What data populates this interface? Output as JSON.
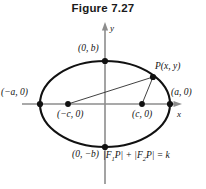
{
  "figure": {
    "title": "Figure 7.27",
    "caption_equation": "|F1P| + |F2P| = k"
  },
  "axes": {
    "x_label": "x",
    "y_label": "y",
    "axis_color": "#8c8c8c"
  },
  "curve": {
    "shape": "ellipse",
    "stroke_color": "#111111",
    "center_px": [
      105,
      104
    ],
    "semi_major_px": 65,
    "semi_minor_px": 43
  },
  "labels": {
    "vertex_left": "(−a, 0)",
    "vertex_right": "(a, 0)",
    "covertex_top": "(0, b)",
    "covertex_bottom": "(0, −b)",
    "focus_left": "(−c, 0)",
    "focus_right": "(c, 0)",
    "point_p": "P(x, y)"
  },
  "equation_parts": {
    "bar_open_1": "|",
    "f1": "F",
    "sub1": "1",
    "p1": "P",
    "bar_close_1": "|",
    "plus": "+",
    "bar_open_2": "|",
    "f2": "F",
    "sub2": "2",
    "p2": "P",
    "bar_close_2": "|",
    "equals": "= k"
  },
  "points": {
    "vertex_left_px": [
      40,
      104
    ],
    "vertex_right_px": [
      170,
      104
    ],
    "covertex_top_px": [
      105,
      61
    ],
    "covertex_bottom_px": [
      105,
      147
    ],
    "focus_left_px": [
      68,
      104
    ],
    "focus_right_px": [
      142,
      104
    ],
    "point_p_px": [
      153,
      77
    ]
  }
}
